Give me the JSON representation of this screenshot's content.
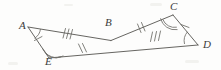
{
  "figure": {
    "name": "two-congruent-triangles-sharing-vertex-b",
    "width": 221,
    "height": 70,
    "background_color": "#fdfdfc",
    "stroke_color": "#55544f",
    "label_color": "#3b3b3b"
  },
  "points": [
    {
      "id": "A",
      "label": "A",
      "x": 28.0,
      "y": 27.0,
      "label_x": 19.0,
      "label_y": 20.0
    },
    {
      "id": "B",
      "label": "B",
      "x": 111.0,
      "y": 40.5,
      "label_x": 104.0,
      "label_y": 17.0
    },
    {
      "id": "C",
      "label": "C",
      "x": 173.0,
      "y": 15.0,
      "label_x": 170.0,
      "label_y": 1.0
    },
    {
      "id": "D",
      "label": "D",
      "x": 198.0,
      "y": 45.0,
      "label_x": 203.0,
      "label_y": 39.0
    },
    {
      "id": "E",
      "label": "E",
      "x": 49.0,
      "y": 58.0,
      "label_x": 45.0,
      "label_y": 56.0
    }
  ],
  "segments": [
    {
      "id": "AB",
      "name": "segment-a-b",
      "from": "A",
      "to": "B",
      "ticks": 3
    },
    {
      "id": "AE",
      "name": "segment-a-e",
      "from": "A",
      "to": "E",
      "ticks": 1
    },
    {
      "id": "EB",
      "name": "segment-e-b",
      "from": "E",
      "to": "B",
      "ticks": 2,
      "extends_to": "D"
    },
    {
      "id": "BC",
      "name": "segment-b-c",
      "from": "B",
      "to": "C",
      "ticks": 2
    },
    {
      "id": "BD",
      "name": "segment-b-d",
      "from": "B",
      "to": "D",
      "ticks": 3
    },
    {
      "id": "CD",
      "name": "segment-c-d",
      "from": "C",
      "to": "D",
      "ticks": 1
    }
  ],
  "angle_marks": [
    {
      "id": "angle-A",
      "name": "angle-arc-a",
      "vertex": "A",
      "arcs": 1
    },
    {
      "id": "angle-E",
      "name": "angle-arc-e",
      "vertex": "E",
      "arcs": 2
    },
    {
      "id": "angle-C",
      "name": "angle-arc-c",
      "vertex": "C",
      "arcs": 2
    },
    {
      "id": "angle-D",
      "name": "angle-arc-d",
      "vertex": "D",
      "arcs": 1
    }
  ]
}
